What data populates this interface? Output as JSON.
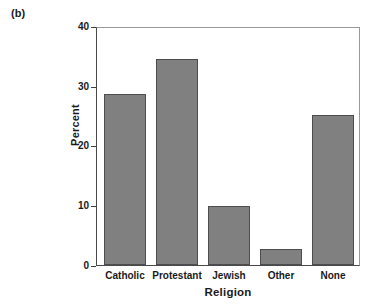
{
  "panel": {
    "label": "(b)"
  },
  "chart_data": {
    "type": "bar",
    "title": "",
    "subtitle": "",
    "xlabel": "Religion",
    "ylabel": "Percent",
    "categories": [
      "Catholic",
      "Protestant",
      "Jewish",
      "Other",
      "None"
    ],
    "values": [
      28.8,
      34.7,
      10.0,
      2.7,
      25.2
    ],
    "series": [
      {
        "name": "Percent",
        "values": [
          28.8,
          34.7,
          10.0,
          2.7,
          25.2
        ]
      }
    ],
    "ylim": [
      0,
      40
    ],
    "yticks": [
      0,
      10,
      20,
      30,
      40
    ],
    "ytick_labels": [
      "0",
      "10",
      "20",
      "30",
      "40"
    ],
    "xlim": [
      0,
      5
    ],
    "grid": false,
    "legend": false,
    "legend_position": "none",
    "annotations": [
      "(b)"
    ],
    "colors": {
      "bar_fill": "#808080",
      "bar_edge": "#4d4d4d",
      "axis": "#3f3f3f",
      "frame": "#9a9a9a",
      "text": "#1a1a1a",
      "background": "#ffffff"
    }
  },
  "caption_sliver": ""
}
